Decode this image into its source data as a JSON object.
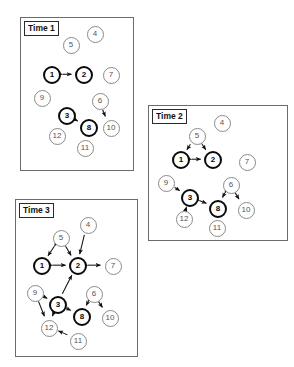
{
  "figure": {
    "node_style": {
      "bold_nodes": [
        1,
        2,
        3,
        8
      ],
      "bold_color": "#0a0a0a",
      "thin_color": "#8a8a8a",
      "background": "#ffffff"
    }
  },
  "panels": [
    {
      "id": "time-1",
      "label": "Time 1",
      "box": {
        "x": 20,
        "y": 17,
        "w": 114,
        "h": 154
      },
      "nodes": [
        {
          "id": 1,
          "label": "1",
          "cx": 31,
          "cy": 57,
          "r": 9,
          "bold": true
        },
        {
          "id": 2,
          "label": "2",
          "cx": 63,
          "cy": 57,
          "r": 9,
          "bold": true
        },
        {
          "id": 3,
          "label": "3",
          "cx": 46,
          "cy": 98,
          "r": 9,
          "bold": true
        },
        {
          "id": 4,
          "label": "4",
          "cx": 74,
          "cy": 16,
          "r": 8.5,
          "bold": false
        },
        {
          "id": 5,
          "label": "5",
          "cx": 50,
          "cy": 27,
          "r": 8.5,
          "bold": false
        },
        {
          "id": 6,
          "label": "6",
          "cx": 79,
          "cy": 83,
          "r": 8.5,
          "bold": false
        },
        {
          "id": 7,
          "label": "7",
          "cx": 90,
          "cy": 57,
          "r": 8.5,
          "bold": false
        },
        {
          "id": 8,
          "label": "8",
          "cx": 68,
          "cy": 110,
          "r": 9,
          "bold": true
        },
        {
          "id": 9,
          "label": "9",
          "cx": 21,
          "cy": 80,
          "r": 8.5,
          "bold": false
        },
        {
          "id": 10,
          "label": "10",
          "cx": 90,
          "cy": 110,
          "r": 8.5,
          "bold": false
        },
        {
          "id": 11,
          "label": "11",
          "cx": 64,
          "cy": 130,
          "r": 8.5,
          "bold": false
        },
        {
          "id": 12,
          "label": "12",
          "cx": 36,
          "cy": 118,
          "r": 8.5,
          "bold": false
        }
      ],
      "edges": [
        {
          "from": 1,
          "to": 2,
          "type": "bidirectional"
        },
        {
          "from": 3,
          "to": 8,
          "type": "bidirectional"
        },
        {
          "from": 6,
          "to": 10,
          "type": "directed"
        }
      ]
    },
    {
      "id": "time-2",
      "label": "Time 2",
      "box": {
        "x": 148,
        "y": 105,
        "w": 140,
        "h": 136
      },
      "nodes": [
        {
          "id": 1,
          "label": "1",
          "cx": 32,
          "cy": 54,
          "r": 9,
          "bold": true
        },
        {
          "id": 2,
          "label": "2",
          "cx": 64,
          "cy": 54,
          "r": 9,
          "bold": true
        },
        {
          "id": 3,
          "label": "3",
          "cx": 41,
          "cy": 92,
          "r": 9,
          "bold": true
        },
        {
          "id": 4,
          "label": "4",
          "cx": 73,
          "cy": 17,
          "r": 8.5,
          "bold": false
        },
        {
          "id": 5,
          "label": "5",
          "cx": 48,
          "cy": 30,
          "r": 8.5,
          "bold": false
        },
        {
          "id": 6,
          "label": "6",
          "cx": 82,
          "cy": 79,
          "r": 8.5,
          "bold": false
        },
        {
          "id": 7,
          "label": "7",
          "cx": 98,
          "cy": 56,
          "r": 8.5,
          "bold": false
        },
        {
          "id": 8,
          "label": "8",
          "cx": 69,
          "cy": 103,
          "r": 9,
          "bold": true
        },
        {
          "id": 9,
          "label": "9",
          "cx": 17,
          "cy": 77,
          "r": 8.5,
          "bold": false
        },
        {
          "id": 10,
          "label": "10",
          "cx": 97,
          "cy": 104,
          "r": 8.5,
          "bold": false
        },
        {
          "id": 11,
          "label": "11",
          "cx": 68,
          "cy": 122,
          "r": 8.5,
          "bold": false
        },
        {
          "id": 12,
          "label": "12",
          "cx": 35,
          "cy": 113,
          "r": 8.5,
          "bold": false
        }
      ],
      "edges": [
        {
          "from": 5,
          "to": 1,
          "type": "directed"
        },
        {
          "from": 5,
          "to": 2,
          "type": "bidirectional"
        },
        {
          "from": 1,
          "to": 2,
          "type": "bidirectional"
        },
        {
          "from": 9,
          "to": 3,
          "type": "directed"
        },
        {
          "from": 3,
          "to": 8,
          "type": "bidirectional"
        },
        {
          "from": 3,
          "to": 12,
          "type": "bidirectional"
        },
        {
          "from": 6,
          "to": 8,
          "type": "bidirectional"
        },
        {
          "from": 6,
          "to": 10,
          "type": "bidirectional"
        }
      ]
    },
    {
      "id": "time-3",
      "label": "Time 3",
      "box": {
        "x": 15,
        "y": 199,
        "w": 123,
        "h": 158
      },
      "nodes": [
        {
          "id": 1,
          "label": "1",
          "cx": 26,
          "cy": 66,
          "r": 9,
          "bold": true
        },
        {
          "id": 2,
          "label": "2",
          "cx": 62,
          "cy": 66,
          "r": 9,
          "bold": true
        },
        {
          "id": 3,
          "label": "3",
          "cx": 42,
          "cy": 105,
          "r": 9,
          "bold": true
        },
        {
          "id": 4,
          "label": "4",
          "cx": 72,
          "cy": 25,
          "r": 8.5,
          "bold": false
        },
        {
          "id": 5,
          "label": "5",
          "cx": 45,
          "cy": 38,
          "r": 8.5,
          "bold": false
        },
        {
          "id": 6,
          "label": "6",
          "cx": 78,
          "cy": 94,
          "r": 8.5,
          "bold": false
        },
        {
          "id": 7,
          "label": "7",
          "cx": 97,
          "cy": 66,
          "r": 8.5,
          "bold": false
        },
        {
          "id": 8,
          "label": "8",
          "cx": 66,
          "cy": 117,
          "r": 9,
          "bold": true
        },
        {
          "id": 9,
          "label": "9",
          "cx": 19,
          "cy": 93,
          "r": 8.5,
          "bold": false
        },
        {
          "id": 10,
          "label": "10",
          "cx": 94,
          "cy": 118,
          "r": 8.5,
          "bold": false
        },
        {
          "id": 11,
          "label": "11",
          "cx": 62,
          "cy": 141,
          "r": 8.5,
          "bold": false
        },
        {
          "id": 12,
          "label": "12",
          "cx": 33,
          "cy": 128,
          "r": 8.5,
          "bold": false
        }
      ],
      "edges": [
        {
          "from": 5,
          "to": 1,
          "type": "bidirectional"
        },
        {
          "from": 5,
          "to": 2,
          "type": "bidirectional"
        },
        {
          "from": 4,
          "to": 2,
          "type": "directed"
        },
        {
          "from": 1,
          "to": 2,
          "type": "bidirectional"
        },
        {
          "from": 2,
          "to": 7,
          "type": "bidirectional"
        },
        {
          "from": 3,
          "to": 2,
          "type": "directed"
        },
        {
          "from": 9,
          "to": 3,
          "type": "bidirectional"
        },
        {
          "from": 9,
          "to": 12,
          "type": "bidirectional"
        },
        {
          "from": 3,
          "to": 12,
          "type": "bidirectional"
        },
        {
          "from": 3,
          "to": 8,
          "type": "bidirectional"
        },
        {
          "from": 6,
          "to": 8,
          "type": "bidirectional"
        },
        {
          "from": 6,
          "to": 10,
          "type": "bidirectional"
        },
        {
          "from": 11,
          "to": 12,
          "type": "directed"
        }
      ]
    }
  ]
}
